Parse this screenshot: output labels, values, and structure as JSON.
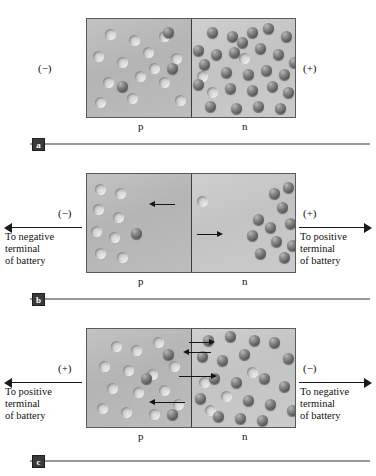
{
  "figure": {
    "colors": {
      "p_region": "#b8b8b8",
      "n_region": "#c8c8c8",
      "electron": "#5a5a5a",
      "hole": "#d8d8d8",
      "junction_line": "#3c3c3c",
      "rule": "#9a9a9a",
      "badge_bg": "#3a3a3a",
      "badge_text": "#ffffff",
      "text": "#111111"
    }
  },
  "panels": [
    {
      "badge": "a",
      "left_polarity": "(−)",
      "right_polarity": "(+)",
      "p_label": "p",
      "n_label": "n",
      "left_terminal": "",
      "right_terminal": "",
      "p_holes": [
        {
          "x": 18,
          "y": 10
        },
        {
          "x": 42,
          "y": 16
        },
        {
          "x": 72,
          "y": 12
        },
        {
          "x": 6,
          "y": 32
        },
        {
          "x": 30,
          "y": 38
        },
        {
          "x": 56,
          "y": 28
        },
        {
          "x": 84,
          "y": 34
        },
        {
          "x": 48,
          "y": 52
        },
        {
          "x": 16,
          "y": 58
        },
        {
          "x": 72,
          "y": 58
        },
        {
          "x": 40,
          "y": 74
        },
        {
          "x": 88,
          "y": 76
        },
        {
          "x": 62,
          "y": 44
        },
        {
          "x": 8,
          "y": 78
        }
      ],
      "p_electrons": [
        {
          "x": 76,
          "y": 8
        },
        {
          "x": 80,
          "y": 44
        },
        {
          "x": 30,
          "y": 62
        }
      ],
      "n_holes": [
        {
          "x": 48,
          "y": 34
        },
        {
          "x": 6,
          "y": 52
        },
        {
          "x": 16,
          "y": 68
        }
      ],
      "n_electrons": [
        {
          "x": 16,
          "y": 8
        },
        {
          "x": 36,
          "y": 12
        },
        {
          "x": 56,
          "y": 8
        },
        {
          "x": 72,
          "y": 4
        },
        {
          "x": 90,
          "y": 12
        },
        {
          "x": 2,
          "y": 26
        },
        {
          "x": 20,
          "y": 30
        },
        {
          "x": 38,
          "y": 28
        },
        {
          "x": 64,
          "y": 24
        },
        {
          "x": 82,
          "y": 30
        },
        {
          "x": 52,
          "y": 50
        },
        {
          "x": 30,
          "y": 48
        },
        {
          "x": 70,
          "y": 46
        },
        {
          "x": 88,
          "y": 50
        },
        {
          "x": 2,
          "y": 60
        },
        {
          "x": 34,
          "y": 64
        },
        {
          "x": 56,
          "y": 66
        },
        {
          "x": 76,
          "y": 62
        },
        {
          "x": 92,
          "y": 68
        },
        {
          "x": 14,
          "y": 82
        },
        {
          "x": 40,
          "y": 84
        },
        {
          "x": 62,
          "y": 82
        },
        {
          "x": 84,
          "y": 84
        },
        {
          "x": 46,
          "y": 18
        },
        {
          "x": 8,
          "y": 40
        },
        {
          "x": 98,
          "y": 38
        }
      ],
      "motion_arrows": []
    },
    {
      "badge": "b",
      "left_polarity": "(−)",
      "right_polarity": "(+)",
      "p_label": "p",
      "n_label": "n",
      "left_terminal": "To negative\nterminal\nof battery",
      "right_terminal": "To positive\nterminal\nof battery",
      "p_holes": [
        {
          "x": 8,
          "y": 10
        },
        {
          "x": 28,
          "y": 14
        },
        {
          "x": 6,
          "y": 30
        },
        {
          "x": 26,
          "y": 38
        },
        {
          "x": 4,
          "y": 52
        },
        {
          "x": 22,
          "y": 58
        },
        {
          "x": 8,
          "y": 74
        },
        {
          "x": 30,
          "y": 78
        }
      ],
      "p_electrons": [
        {
          "x": 44,
          "y": 54
        }
      ],
      "n_holes": [
        {
          "x": 6,
          "y": 22
        }
      ],
      "n_electrons": [
        {
          "x": 78,
          "y": 14
        },
        {
          "x": 92,
          "y": 8
        },
        {
          "x": 86,
          "y": 28
        },
        {
          "x": 62,
          "y": 40
        },
        {
          "x": 74,
          "y": 48
        },
        {
          "x": 94,
          "y": 44
        },
        {
          "x": 56,
          "y": 56
        },
        {
          "x": 80,
          "y": 62
        },
        {
          "x": 96,
          "y": 66
        },
        {
          "x": 64,
          "y": 74
        },
        {
          "x": 88,
          "y": 78
        }
      ],
      "motion_arrows": [
        {
          "dir": "left",
          "x": 62,
          "y": 27,
          "w": 26
        },
        {
          "dir": "right",
          "x": 110,
          "y": 57,
          "w": 26
        }
      ]
    },
    {
      "badge": "c",
      "left_polarity": "(+)",
      "right_polarity": "(−)",
      "p_label": "p",
      "n_label": "n",
      "left_terminal": "To positive\nterminal\nof battery",
      "right_terminal": "To negative\nterminal\nof battery",
      "p_holes": [
        {
          "x": 24,
          "y": 12
        },
        {
          "x": 44,
          "y": 16
        },
        {
          "x": 66,
          "y": 8
        },
        {
          "x": 12,
          "y": 32
        },
        {
          "x": 36,
          "y": 36
        },
        {
          "x": 60,
          "y": 40
        },
        {
          "x": 82,
          "y": 32
        },
        {
          "x": 20,
          "y": 54
        },
        {
          "x": 46,
          "y": 58
        },
        {
          "x": 72,
          "y": 56
        },
        {
          "x": 10,
          "y": 74
        },
        {
          "x": 34,
          "y": 78
        },
        {
          "x": 62,
          "y": 80
        },
        {
          "x": 86,
          "y": 70
        }
      ],
      "p_electrons": [
        {
          "x": 76,
          "y": 20
        },
        {
          "x": 54,
          "y": 44
        },
        {
          "x": 80,
          "y": 80
        }
      ],
      "n_holes": [
        {
          "x": 56,
          "y": 38
        },
        {
          "x": 8,
          "y": 48
        },
        {
          "x": 30,
          "y": 62
        },
        {
          "x": 14,
          "y": 76
        }
      ],
      "n_electrons": [
        {
          "x": 12,
          "y": 6
        },
        {
          "x": 34,
          "y": 2
        },
        {
          "x": 78,
          "y": 8
        },
        {
          "x": 6,
          "y": 22
        },
        {
          "x": 26,
          "y": 26
        },
        {
          "x": 48,
          "y": 20
        },
        {
          "x": 92,
          "y": 24
        },
        {
          "x": 18,
          "y": 44
        },
        {
          "x": 40,
          "y": 48
        },
        {
          "x": 68,
          "y": 44
        },
        {
          "x": 88,
          "y": 52
        },
        {
          "x": 4,
          "y": 64
        },
        {
          "x": 52,
          "y": 66
        },
        {
          "x": 74,
          "y": 70
        },
        {
          "x": 22,
          "y": 82
        },
        {
          "x": 44,
          "y": 84
        },
        {
          "x": 66,
          "y": 86
        },
        {
          "x": 96,
          "y": 76
        },
        {
          "x": 58,
          "y": 6
        }
      ],
      "motion_arrows": [
        {
          "dir": "right",
          "x": 102,
          "y": 10,
          "w": 26
        },
        {
          "dir": "left",
          "x": 96,
          "y": 20,
          "w": 28
        },
        {
          "dir": "right",
          "x": 92,
          "y": 44,
          "w": 38
        },
        {
          "dir": "left",
          "x": 62,
          "y": 70,
          "w": 36
        }
      ]
    }
  ]
}
